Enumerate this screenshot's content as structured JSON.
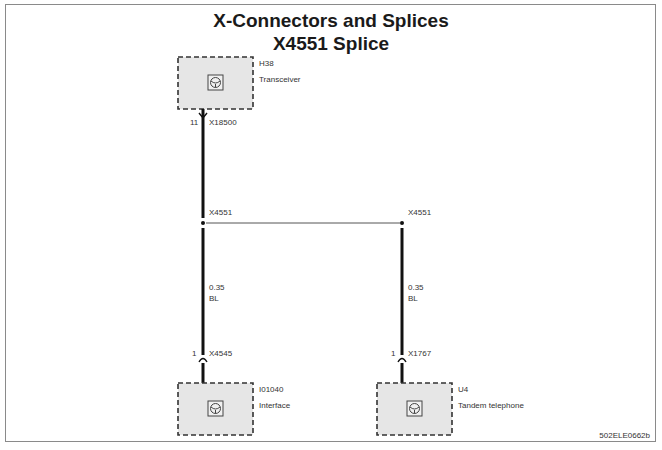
{
  "title": {
    "line1": "X-Connectors and Splices",
    "line2": "X4551 Splice"
  },
  "components": [
    {
      "id": "H38",
      "name": "Transceiver",
      "icon": "component-symbol-icon"
    },
    {
      "id": "I01040",
      "name": "Interface",
      "icon": "component-symbol-icon"
    },
    {
      "id": "U4",
      "name": "Tandem telephone",
      "icon": "component-symbol-icon"
    }
  ],
  "connectors": [
    {
      "pin": "11",
      "name": "X18500"
    },
    {
      "pin": "1",
      "name": "X4545"
    },
    {
      "pin": "1",
      "name": "X1767"
    }
  ],
  "splices": [
    {
      "name": "X4551"
    },
    {
      "name": "X4551"
    }
  ],
  "wires": [
    {
      "gauge": "0.35",
      "color": "BL"
    },
    {
      "gauge": "0.35",
      "color": "BL"
    }
  ],
  "colors": {
    "wire": "#111111",
    "box_fill": "#e6e6e6",
    "box_border": "#333333"
  },
  "reference": "502ELE0662b"
}
